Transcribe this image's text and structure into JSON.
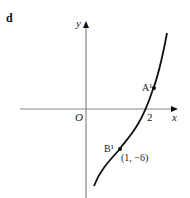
{
  "figure": {
    "part_label": "d",
    "axes": {
      "x_label": "x",
      "y_label": "y",
      "origin_label": "O",
      "axis_color": "#888888"
    },
    "curve": {
      "color": "#111111",
      "description": "increasing cubic-like curve through (2,0) with inflection near B"
    },
    "x_intercept_label": "2",
    "points": [
      {
        "name": "A",
        "label": "A¹"
      },
      {
        "name": "B",
        "label": "B¹",
        "coords_label": "(1, −6)"
      }
    ]
  }
}
